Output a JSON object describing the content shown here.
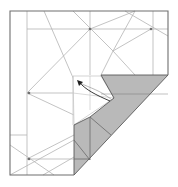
{
  "diagram": {
    "type": "origami-fold-step",
    "colors": {
      "background": "#ffffff",
      "outline": "#6f6f6f",
      "crease": "#b4b4b4",
      "shade": "#b9b9b9",
      "shade_edge": "#5a5a5a",
      "arrow": "#222222",
      "dot": "#707070"
    },
    "icons": {
      "fold_arrow": "curved-arrow-icon"
    }
  }
}
